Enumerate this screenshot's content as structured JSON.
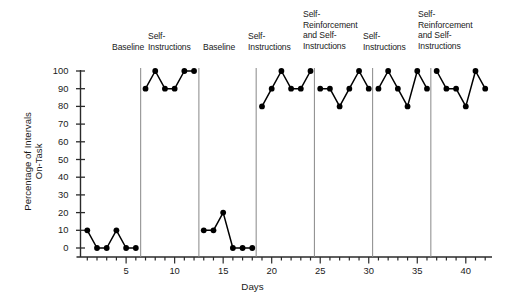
{
  "chart_data": {
    "type": "line",
    "title": "",
    "xlabel": "Days",
    "ylabel": "Percentage of Intervals\nOn-Task",
    "xlim": [
      0.3,
      42.7
    ],
    "ylim": [
      0,
      100
    ],
    "ytick_labels": [
      "0",
      "10",
      "20",
      "30",
      "40",
      "50",
      "60",
      "70",
      "80",
      "90",
      "100"
    ],
    "ytick_values": [
      0,
      10,
      20,
      30,
      40,
      50,
      60,
      70,
      80,
      90,
      100
    ],
    "xtick_labels": [
      "5",
      "10",
      "15",
      "20",
      "25",
      "30",
      "35",
      "40"
    ],
    "xtick_values": [
      5,
      10,
      15,
      20,
      25,
      30,
      35,
      40
    ],
    "xtick_minor_every": 1,
    "grid": false,
    "legend": "none",
    "marker": "filled-circle",
    "line_color": "#000000",
    "marker_color": "#000000",
    "phase_line_color": "#888888",
    "x": [
      1,
      2,
      3,
      4,
      5,
      6,
      7,
      8,
      9,
      10,
      11,
      12,
      13,
      14,
      15,
      16,
      17,
      18,
      19,
      20,
      21,
      22,
      23,
      24,
      25,
      26,
      27,
      28,
      29,
      30,
      31,
      32,
      33,
      34,
      35,
      36,
      37,
      38,
      39,
      40,
      41,
      42
    ],
    "values": [
      10,
      0,
      0,
      10,
      0,
      0,
      90,
      100,
      90,
      90,
      100,
      100,
      10,
      10,
      20,
      0,
      0,
      0,
      80,
      90,
      100,
      90,
      90,
      100,
      90,
      90,
      80,
      90,
      100,
      90,
      90,
      100,
      90,
      80,
      100,
      90,
      100,
      90,
      90,
      80,
      100,
      90
    ],
    "phases": [
      {
        "label": "Baseline",
        "days": [
          1,
          6
        ],
        "values": [
          10,
          0,
          0,
          10,
          0,
          0
        ],
        "label_x": 112,
        "label_y": 42
      },
      {
        "label": "Self-\nInstructions",
        "days": [
          7,
          12
        ],
        "values": [
          90,
          100,
          90,
          90,
          100,
          100
        ],
        "label_x": 148,
        "label_y": 31
      },
      {
        "label": "Baseline",
        "days": [
          13,
          18
        ],
        "values": [
          10,
          10,
          20,
          0,
          0,
          0
        ],
        "label_x": 203,
        "label_y": 42
      },
      {
        "label": "Self-\nInstructions",
        "days": [
          19,
          24
        ],
        "values": [
          80,
          90,
          100,
          90,
          90,
          100
        ],
        "label_x": 248,
        "label_y": 31
      },
      {
        "label": "Self-\nReinforcement\nand Self-\nInstructions",
        "days": [
          25,
          30
        ],
        "values": [
          90,
          90,
          80,
          90,
          100,
          90
        ],
        "label_x": 303,
        "label_y": 9
      },
      {
        "label": "Self-\nInstructions",
        "days": [
          31,
          36
        ],
        "values": [
          90,
          100,
          90,
          80,
          100,
          90
        ],
        "label_x": 363,
        "label_y": 31
      },
      {
        "label": "Self-\nReinforcement\nand Self-\nInstructions",
        "days": [
          37,
          42
        ],
        "values": [
          100,
          90,
          90,
          80,
          100,
          90
        ],
        "label_x": 418,
        "label_y": 9
      }
    ],
    "phase_separators_x": [
      6.5,
      12.5,
      18.4,
      24.4,
      30.4,
      36.4
    ]
  }
}
